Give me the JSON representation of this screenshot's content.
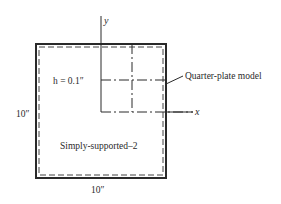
{
  "figure": {
    "plate": {
      "width_label": "10″",
      "height_label": "10″",
      "thickness_label": "h = 0.1″",
      "boundary_label": "Simply-supported–2"
    },
    "axes": {
      "x_label": "x",
      "y_label": "y"
    },
    "callout": {
      "label": "Quarter-plate model"
    },
    "colors": {
      "line": "#2a2a2a",
      "background": "#ffffff"
    }
  }
}
